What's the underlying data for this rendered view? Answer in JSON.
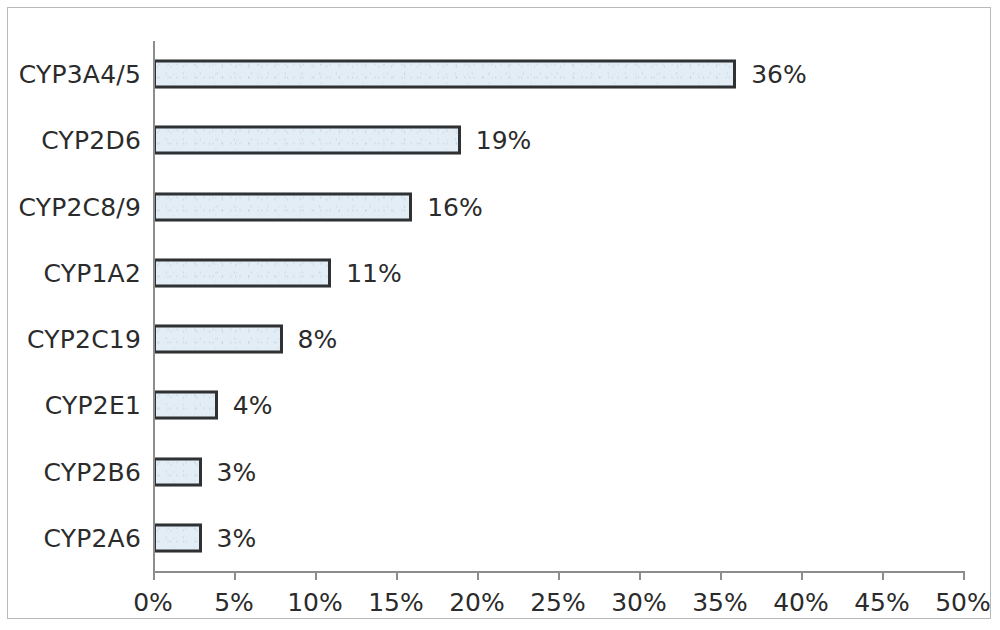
{
  "chart_data": {
    "type": "bar",
    "orientation": "horizontal",
    "title": "",
    "subtitle": "",
    "xlabel": "",
    "ylabel": "",
    "categories": [
      "CYP3A4/5",
      "CYP2D6",
      "CYP2C8/9",
      "CYP1A2",
      "CYP2C19",
      "CYP2E1",
      "CYP2B6",
      "CYP2A6"
    ],
    "values": [
      36,
      19,
      16,
      11,
      8,
      4,
      3,
      3
    ],
    "data_labels": [
      "36%",
      "19%",
      "16%",
      "11%",
      "8%",
      "4%",
      "3%",
      "3%"
    ],
    "xlim": [
      0,
      50
    ],
    "xtick_values": [
      0,
      5,
      10,
      15,
      20,
      25,
      30,
      35,
      40,
      45,
      50
    ],
    "xtick_labels": [
      "0%",
      "5%",
      "10%",
      "15%",
      "20%",
      "25%",
      "30%",
      "35%",
      "40%",
      "45%",
      "50%"
    ],
    "grid": false,
    "legend": null,
    "legend_position": "none",
    "value_unit": "%",
    "series": [
      {
        "name": "",
        "values": [
          36,
          19,
          16,
          11,
          8,
          4,
          3,
          3
        ]
      }
    ],
    "colors": {
      "bar_fill": "#e2edf5",
      "bar_border": "#2f3133",
      "axis": "#8d8d8d",
      "text": "#2b2b2b",
      "frame": "#b9b9b9",
      "background": "#ffffff"
    }
  }
}
